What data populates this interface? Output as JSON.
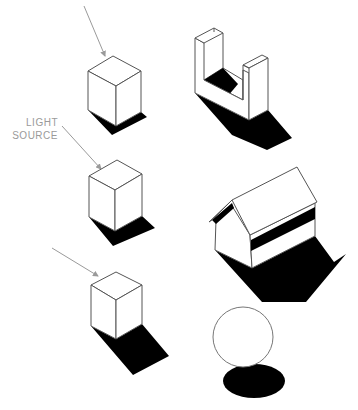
{
  "diagram": {
    "label_line1": "LIGHT",
    "label_line2": "SOURCE",
    "colors": {
      "background": "#ffffff",
      "outline": "#555555",
      "shadow": "#000000",
      "arrow": "#9a9a9a",
      "label": "#9a9a9a"
    },
    "figures": [
      {
        "name": "cube-1",
        "shape": "cube",
        "shadow": "short"
      },
      {
        "name": "u-block",
        "shape": "u-shaped block",
        "shadow": "cast"
      },
      {
        "name": "cube-2",
        "shape": "cube",
        "shadow": "medium"
      },
      {
        "name": "house",
        "shape": "house",
        "shadow": "cast"
      },
      {
        "name": "cube-3",
        "shape": "cube",
        "shadow": "long"
      },
      {
        "name": "sphere",
        "shape": "sphere",
        "shadow": "ellipse below"
      }
    ],
    "arrows": [
      {
        "name": "light-arrow-1",
        "from": [
          84,
          6
        ],
        "to": [
          105,
          56
        ]
      },
      {
        "name": "light-arrow-2",
        "from": [
          62,
          126
        ],
        "to": [
          101,
          169
        ]
      },
      {
        "name": "light-arrow-3",
        "from": [
          52,
          248
        ],
        "to": [
          98,
          276
        ]
      }
    ]
  }
}
